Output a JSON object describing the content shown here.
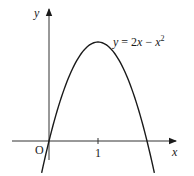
{
  "figure": {
    "type": "function-graph",
    "equation_label": {
      "lhs": "y",
      "eq": " = 2",
      "x1": "x",
      "minus": " − ",
      "x2": "x",
      "exp": "2"
    },
    "axes": {
      "x_label": "x",
      "y_label": "y",
      "origin_label": "O"
    },
    "ticks": [
      {
        "value": 1,
        "label": "1"
      }
    ],
    "curve": {
      "expression": "y = 2x - x^2",
      "vertex": [
        1,
        1
      ],
      "roots": [
        0,
        2
      ],
      "domain": [
        -0.15,
        2.15
      ]
    },
    "colors": {
      "ink": "#1a1a1a",
      "axis": "#333333",
      "background": "#ffffff"
    }
  }
}
